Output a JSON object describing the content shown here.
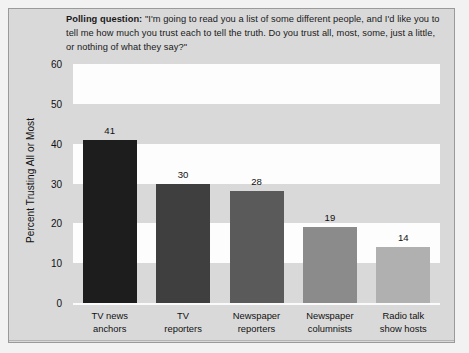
{
  "chart_data": {
    "type": "bar",
    "title": "Polling question: \"I'm going to read you a list of some different people, and I'd like you to tell me how much you trust each to tell the truth. Do you trust all, most, some, just a little, or nothing of what they say?\"",
    "title_label": "Polling question:",
    "title_body": " \"I'm going to read you a list of some different people, and I'd like you to tell me how much you trust each to tell the truth. Do you trust all, most, some, just a little, or nothing of what they say?\"",
    "categories": [
      "TV news anchors",
      "TV reporters",
      "Newspaper reporters",
      "Newspaper columnists",
      "Radio talk show hosts"
    ],
    "category_lines": [
      [
        "TV news",
        "anchors"
      ],
      [
        "TV",
        "reporters"
      ],
      [
        "Newspaper",
        "reporters"
      ],
      [
        "Newspaper",
        "columnists"
      ],
      [
        "Radio talk",
        "show hosts"
      ]
    ],
    "values": [
      41,
      30,
      28,
      19,
      14
    ],
    "value_labels": [
      "41",
      "30",
      "28",
      "19",
      "14"
    ],
    "bar_colors": [
      "#1d1d1d",
      "#3f3f3f",
      "#5a5a5a",
      "#8b8b8b",
      "#b0b0b0"
    ],
    "xlabel": "",
    "ylabel": "Percent Trusting All or Most",
    "ylim": [
      0,
      60
    ],
    "yticks": [
      0,
      10,
      20,
      30,
      40,
      50,
      60
    ],
    "ytick_labels": [
      "0",
      "10",
      "20",
      "30",
      "40",
      "50",
      "60"
    ],
    "grid": false,
    "banding": "alternating white horizontal bands at 10-20, 30-40, 50-60",
    "legend": null,
    "plot_background": "#d9d9d9",
    "band_color": "#fdfdfd",
    "figure_background": "#f2f2f2"
  }
}
